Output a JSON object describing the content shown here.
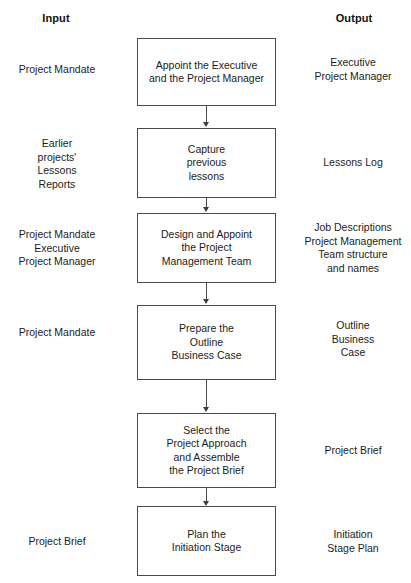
{
  "diagram": {
    "headers": {
      "input": "Input",
      "output": "Output"
    },
    "line_color": "#4a4a4a",
    "text_color": "#1c1c1c",
    "background": "#ffffff",
    "steps": [
      {
        "input": "Project Mandate",
        "process": "Appoint the Executive\nand the Project Manager",
        "output": "Executive\nProject Manager"
      },
      {
        "input": "Earlier\nprojects'\nLessons\nReports",
        "process": "Capture\nprevious\nlessons",
        "output": "Lessons Log"
      },
      {
        "input": "Project Mandate\nExecutive\nProject Manager",
        "process": "Design and Appoint\nthe Project\nManagement Team",
        "output": "Job Descriptions\nProject Management\nTeam structure\nand names"
      },
      {
        "input": "Project Mandate",
        "process": "Prepare the\nOutline\nBusiness Case",
        "output": "Outline\nBusiness\nCase"
      },
      {
        "input": "",
        "process": "Select the\nProject Approach\nand Assemble\nthe Project Brief",
        "output": "Project Brief"
      },
      {
        "input": "Project Brief",
        "process": "Plan the\nInitiation Stage",
        "output": "Initiation\nStage Plan"
      }
    ]
  }
}
